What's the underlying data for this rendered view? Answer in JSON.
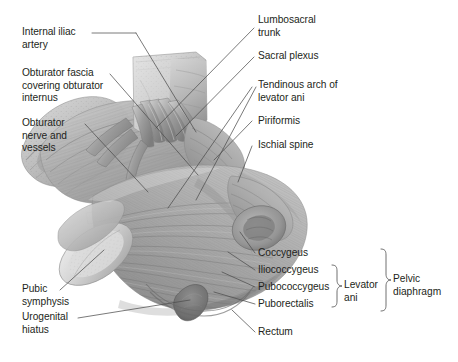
{
  "figure": {
    "background_color": "#ffffff",
    "text_color": "#231f20",
    "leader_line_color": "#4d4d4d",
    "illustration_style": "grayscale anatomical halftone drawing"
  },
  "labels_left": [
    {
      "id": "internal-iliac-artery",
      "text": "Internal iliac\nartery"
    },
    {
      "id": "obturator-fascia",
      "text": "Obturator fascia\ncovering obturator\ninternus"
    },
    {
      "id": "obturator-nerve-vessels",
      "text": "Obturator\nnerve and\nvessels"
    },
    {
      "id": "pubic-symphysis",
      "text": "Pubic\nsymphysis"
    },
    {
      "id": "urogenital-hiatus",
      "text": "Urogenital\nhiatus"
    }
  ],
  "labels_right_top": [
    {
      "id": "lumbosacral-trunk",
      "text": "Lumbosacral\ntrunk"
    },
    {
      "id": "sacral-plexus",
      "text": "Sacral plexus"
    },
    {
      "id": "tendinous-arch",
      "text": "Tendinous arch of\nlevator ani"
    },
    {
      "id": "piriformis",
      "text": "Piriformis"
    },
    {
      "id": "ischial-spine",
      "text": "Ischial spine"
    }
  ],
  "labels_right_bottom": [
    {
      "id": "coccygeus",
      "text": "Coccygeus"
    },
    {
      "id": "iliococcygeus",
      "text": "Iliococcygeus"
    },
    {
      "id": "pubococcygeus",
      "text": "Pubococcygeus"
    },
    {
      "id": "puborectalis",
      "text": "Puborectalis"
    },
    {
      "id": "rectum",
      "text": "Rectum"
    }
  ],
  "group_braces": [
    {
      "id": "levator-ani",
      "text": "Levator\nani",
      "members": [
        "Iliococcygeus",
        "Pubococcygeus",
        "Puborectalis"
      ]
    },
    {
      "id": "pelvic-diaphragm",
      "text": "Pelvic\ndiaphragm",
      "members": [
        "Coccygeus",
        "Levator ani"
      ]
    }
  ]
}
